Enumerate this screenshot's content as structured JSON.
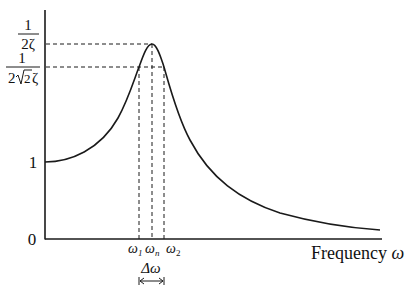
{
  "diagram": {
    "y_axis": {
      "ticks": [
        {
          "id": "peak",
          "numerator": "1",
          "denominator": "2ζ",
          "y": 44
        },
        {
          "id": "half_power",
          "numerator": "1",
          "denominator_prefix": "2",
          "denominator_sqrt": "2",
          "denominator_suffix": "ζ",
          "y": 67
        },
        {
          "id": "one",
          "label": "1",
          "y": 162
        },
        {
          "id": "zero",
          "label": "0",
          "y": 239
        }
      ]
    },
    "x_axis": {
      "label": "Frequency ",
      "label_symbol": "ω",
      "ticks": [
        {
          "id": "omega1",
          "symbol": "ω",
          "sub": "1",
          "x": 139
        },
        {
          "id": "omegan",
          "symbol": "ω",
          "sub": "n",
          "x": 152
        },
        {
          "id": "omega2",
          "symbol": "ω",
          "sub": "2",
          "x": 164
        }
      ]
    },
    "bandwidth": {
      "label": "Δω"
    },
    "colors": {
      "line": "#1a1a1a",
      "background": "#ffffff"
    }
  }
}
